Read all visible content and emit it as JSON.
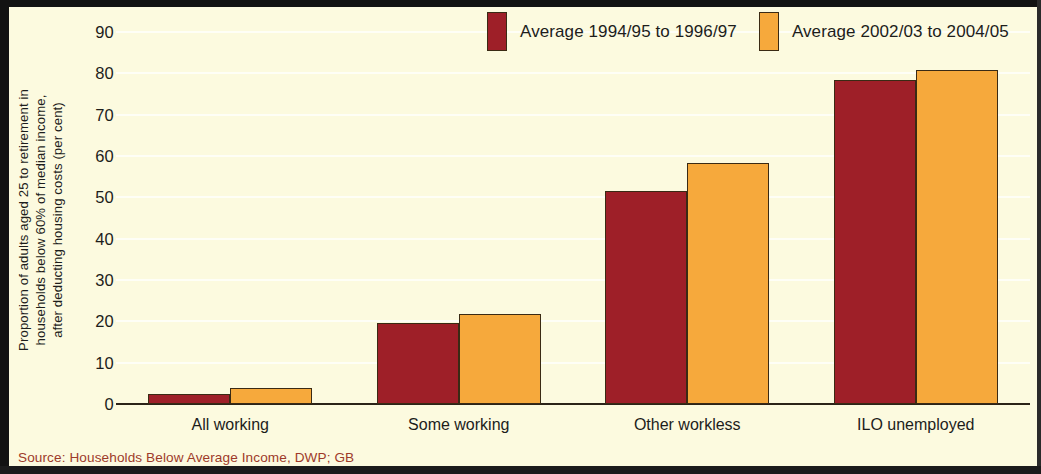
{
  "chart_data": {
    "type": "bar",
    "title": "",
    "subtitle": "",
    "xlabel": "",
    "ylabel": "Proportion of adults aged 25 to retirement in households below 60% of median income, after deducting housing costs (per cent)",
    "ylabel_lines": [
      "Proportion of adults aged 25 to retirement in",
      "households below 60% of median income,",
      "after deducting housing costs (per cent)"
    ],
    "categories": [
      "All working",
      "Some working",
      "Other workless",
      "ILO unemployed"
    ],
    "series": [
      {
        "name": "Average 1994/95 to 1996/97",
        "color": "#9e1f28",
        "values": [
          2.5,
          19.5,
          51.5,
          78.3
        ]
      },
      {
        "name": "Average 2002/03 to 2004/05",
        "color": "#f6a93c",
        "values": [
          3.9,
          21.7,
          58.2,
          80.8
        ]
      }
    ],
    "ylim": [
      0,
      90
    ],
    "ytick_values": [
      0,
      10,
      20,
      30,
      40,
      50,
      60,
      70,
      80,
      90
    ],
    "ytick_labels": [
      "0",
      "10",
      "20",
      "30",
      "40",
      "50",
      "60",
      "70",
      "80",
      "90"
    ],
    "grid": true,
    "grid_axis": "y",
    "legend_position": "top-right",
    "source_note": "Source: Households Below Average Income, DWP; GB",
    "background_color": "#fcfadf",
    "source_color": "#9e3a2a"
  }
}
